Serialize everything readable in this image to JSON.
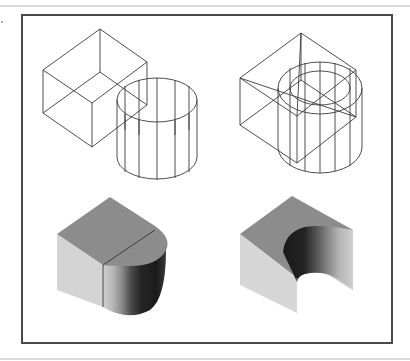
{
  "figure": {
    "type": "cad-solid-modeling-illustration",
    "panels": [
      {
        "id": "wireframe-union",
        "description": "wireframe box overlapped by cylinder (union inputs)"
      },
      {
        "id": "wireframe-subtract",
        "description": "wireframe box with cylinder inside (subtraction inputs)"
      },
      {
        "id": "shaded-union",
        "description": "shaded solid: box unioned with cylinder (rounded end)"
      },
      {
        "id": "shaded-subtract",
        "description": "shaded solid: box with cylindrical cavity subtracted"
      }
    ],
    "colors": {
      "frame": "#4a4a4a",
      "wire": "#3a3a3a",
      "top_face": "#8c8c8c",
      "left_face": "#d4d4d4",
      "dark_face": "#1e1e1e",
      "rule": "#dcdcdc"
    }
  }
}
